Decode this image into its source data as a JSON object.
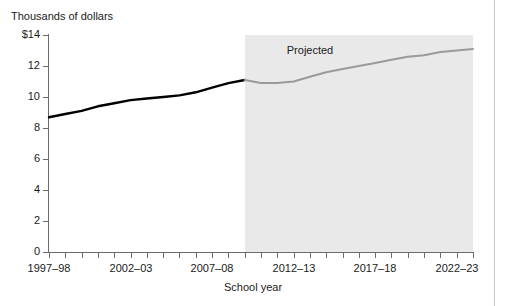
{
  "chart_data": {
    "type": "line",
    "title": "Thousands of dollars",
    "subtitle": "",
    "xlabel": "School year",
    "ylabel": "Thousands of dollars",
    "ylim": [
      0,
      14
    ],
    "y_ticks": [
      0,
      2,
      4,
      6,
      8,
      10,
      12,
      14
    ],
    "y_tick_labels": [
      "0",
      "2",
      "4",
      "6",
      "8",
      "10",
      "12",
      "$14"
    ],
    "x_tick_labels": [
      "1997–98",
      "2002–03",
      "2007–08",
      "2012–13",
      "2017–18",
      "2022–23"
    ],
    "x_all_categories": [
      "1997–98",
      "1998–99",
      "1999–2000",
      "2000–01",
      "2001–02",
      "2002–03",
      "2003–04",
      "2004–05",
      "2005–06",
      "2006–07",
      "2007–08",
      "2008–09",
      "2009–10",
      "2010–11",
      "2011–12",
      "2012–13",
      "2013–14",
      "2014–15",
      "2015–16",
      "2016–17",
      "2017–18",
      "2018–19",
      "2019–20",
      "2020–21",
      "2021–22",
      "2022–23",
      "2023–24"
    ],
    "grid": false,
    "legend_position": "none",
    "annotations": [
      {
        "text": "Projected",
        "x_category": "2013–14",
        "y_value": 13.4
      }
    ],
    "shaded_region": {
      "label": "Projected",
      "start_category": "2009–10",
      "end_category": "2023–24",
      "color": "#e9e9e9"
    },
    "series": [
      {
        "name": "Actual",
        "color": "#000000",
        "style": "solid",
        "x": [
          "1997–98",
          "1998–99",
          "1999–2000",
          "2000–01",
          "2001–02",
          "2002–03",
          "2003–04",
          "2004–05",
          "2005–06",
          "2006–07",
          "2007–08",
          "2008–09",
          "2009–10"
        ],
        "values": [
          8.7,
          8.9,
          9.1,
          9.4,
          9.6,
          9.8,
          9.9,
          10.0,
          10.1,
          10.3,
          10.6,
          10.9,
          11.1
        ]
      },
      {
        "name": "Projected",
        "color": "#9a9a9a",
        "style": "solid",
        "x": [
          "2009–10",
          "2010–11",
          "2011–12",
          "2012–13",
          "2013–14",
          "2014–15",
          "2015–16",
          "2016–17",
          "2017–18",
          "2018–19",
          "2019–20",
          "2020–21",
          "2021–22",
          "2022–23",
          "2023–24"
        ],
        "values": [
          11.1,
          10.9,
          10.9,
          11.0,
          11.3,
          11.6,
          11.8,
          12.0,
          12.2,
          12.4,
          12.6,
          12.7,
          12.9,
          13.0,
          13.1
        ]
      }
    ]
  },
  "colors": {
    "actual_line": "#000000",
    "projected_line": "#9a9a9a",
    "projected_band": "#e9e9e9",
    "axis": "#6b6b6b",
    "text": "#1a1a1a"
  }
}
